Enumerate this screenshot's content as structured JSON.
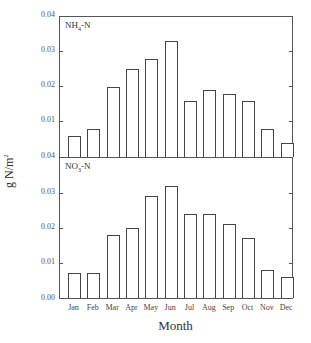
{
  "chart_data": [
    {
      "type": "bar",
      "title": "NH4-N",
      "panel_label": "NH₄-N",
      "categories": [
        "Jan",
        "Feb",
        "Mar",
        "Apr",
        "May",
        "Jun",
        "Jul",
        "Aug",
        "Sep",
        "Oct",
        "Nov",
        "Dec"
      ],
      "values": [
        0.006,
        0.008,
        0.02,
        0.025,
        0.028,
        0.033,
        0.016,
        0.019,
        0.018,
        0.016,
        0.008,
        0.004
      ],
      "xlabel": "",
      "ylabel": "g N/m2",
      "ylim": [
        0,
        0.04
      ],
      "yticks": [
        "0.04",
        "0.03",
        "0.02",
        "0.01",
        "0.04"
      ],
      "grid": false
    },
    {
      "type": "bar",
      "title": "NO3-N",
      "panel_label": "NO₃-N",
      "categories": [
        "Jan",
        "Feb",
        "Mar",
        "Apr",
        "May",
        "Jun",
        "Jul",
        "Aug",
        "Sep",
        "Oct",
        "Nov",
        "Dec"
      ],
      "values": [
        0.007,
        0.007,
        0.018,
        0.02,
        0.029,
        0.032,
        0.024,
        0.024,
        0.021,
        0.017,
        0.008,
        0.006
      ],
      "xlabel": "Month",
      "ylabel": "g N/m2",
      "ylim": [
        0,
        0.04
      ],
      "yticks": [
        "0.03",
        "0.02",
        "0.01",
        "0.00"
      ],
      "grid": false
    }
  ],
  "axis": {
    "ylabel": "g N/m",
    "ylabel_sup": "2",
    "xlabel": "Month",
    "top_yticks": [
      "0.04",
      "0.03",
      "0.02",
      "0.01",
      "0.04"
    ],
    "bottom_yticks": [
      "0.03",
      "0.02",
      "0.01",
      "0.00"
    ],
    "months": [
      "Jan",
      "Feb",
      "Mar",
      "Apr",
      "May",
      "Jun",
      "Jul",
      "Aug",
      "Sep",
      "Oct",
      "Nov",
      "Dec"
    ]
  },
  "panels": {
    "top_label_main": "NH",
    "top_label_sub": "4",
    "top_label_tail": "-N",
    "bottom_label_main": "NO",
    "bottom_label_sub": "3",
    "bottom_label_tail": "-N"
  }
}
